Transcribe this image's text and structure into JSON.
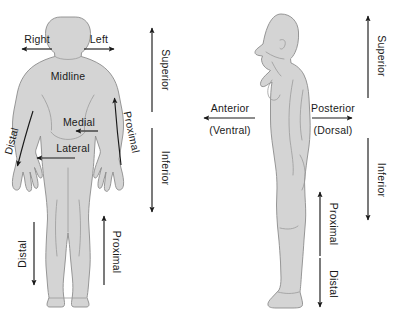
{
  "figure": {
    "caption": "",
    "body_fill_color": "#d4d4d4",
    "body_outline_color": "#8c8c8c",
    "arrow_color": "#1a1a1a",
    "background_color": "#ffffff"
  },
  "anterior_view": {
    "name": "Anterior (front) view of female body",
    "labels": {
      "right": "Right",
      "left": "Left",
      "midline": "Midline",
      "medial": "Medial",
      "lateral": "Lateral",
      "superior": "Superior",
      "inferior": "Inferior",
      "proximal_arm": "Proximal",
      "distal_arm": "Distal",
      "proximal_leg": "Proximal",
      "distal_leg": "Distal"
    }
  },
  "lateral_view": {
    "name": "Lateral (side) view of female body",
    "labels": {
      "anterior": "Anterior",
      "ventral": "(Ventral)",
      "posterior": "Posterior",
      "dorsal": "(Dorsal)",
      "superior": "Superior",
      "inferior": "Inferior",
      "proximal_leg": "Proximal",
      "distal_leg": "Distal"
    }
  }
}
